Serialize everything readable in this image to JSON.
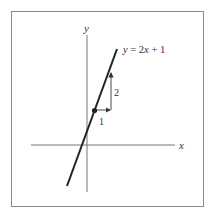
{
  "diagram": {
    "equation_label": "y = 2x + 1",
    "x_axis_label": "x",
    "y_axis_label": "y",
    "run_label": "1",
    "rise_label": "2",
    "line": {
      "slope": 2,
      "intercept": 1
    },
    "point": {
      "x": 0.5,
      "y": 2
    },
    "colors": {
      "line": "#222222",
      "axes": "#777777",
      "frame": "#8a8a8a",
      "text": "#333333"
    }
  }
}
